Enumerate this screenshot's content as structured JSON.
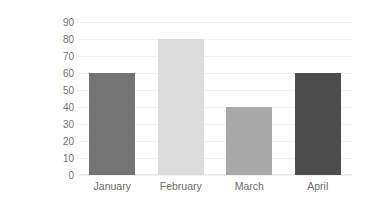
{
  "chart_data": {
    "type": "bar",
    "title": "",
    "xlabel": "",
    "ylabel": "Hours Practiced",
    "categories": [
      "January",
      "February",
      "March",
      "April"
    ],
    "values": [
      60,
      80,
      40,
      60
    ],
    "ylim": [
      0,
      90
    ],
    "ytick_step": 10,
    "yticks": [
      "90",
      "80",
      "70",
      "60",
      "50",
      "40",
      "30",
      "20",
      "10",
      "0"
    ],
    "grid": true,
    "legend": "none",
    "bar_colors": [
      "#737373",
      "#dcdcdc",
      "#a8a8a8",
      "#4d4d4d"
    ],
    "gridline_color": "#f2f2f2",
    "background": "#ffffff",
    "text_color": "#6d6d6d"
  }
}
